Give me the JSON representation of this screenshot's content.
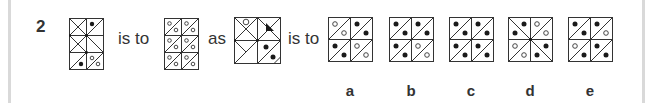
{
  "question": {
    "number": "2",
    "connector_is_to_1": "is to",
    "connector_as": "as",
    "connector_is_to_2": "is to"
  },
  "figures": {
    "A": {
      "description": "2x3 grid of triangle-divided squares with black dots and small open-circle pairs"
    },
    "B": {
      "description": "2x3 grid of squares, each split by a diagonal with open circles (percent-like)"
    },
    "C": {
      "description": "2x2 grid with X-divided squares, one open circle, one black triangle and two black dots"
    }
  },
  "options": [
    {
      "label": "a"
    },
    {
      "label": "b"
    },
    {
      "label": "c"
    },
    {
      "label": "d"
    },
    {
      "label": "e"
    }
  ],
  "colors": {
    "line": "#333333",
    "fill_dot": "#1a1a1a",
    "border_rule": "#d9d9d9"
  }
}
